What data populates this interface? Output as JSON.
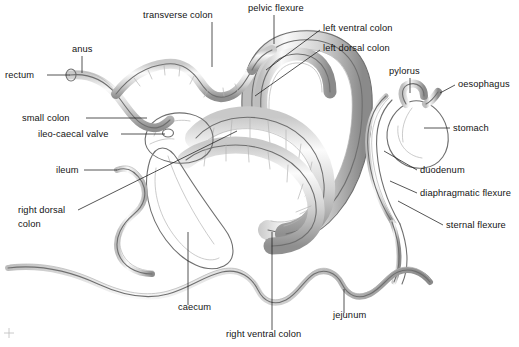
{
  "figure": {
    "background_color": "#ffffff",
    "ink_color": "#141414",
    "organ_outline_color": "#6f6f6f",
    "organ_shade_color": "#b4b4b4",
    "width": 519,
    "height": 347
  },
  "labels": [
    {
      "id": "transverse-colon",
      "text": "transverse colon",
      "x": 143,
      "y": 18,
      "anchor": "start"
    },
    {
      "id": "pelvic-flexure",
      "text": "pelvic flexure",
      "x": 248,
      "y": 11,
      "anchor": "start"
    },
    {
      "id": "left-ventral-colon",
      "text": "left ventral colon",
      "x": 323,
      "y": 31,
      "anchor": "start"
    },
    {
      "id": "left-dorsal-colon",
      "text": "left dorsal colon",
      "x": 323,
      "y": 51,
      "anchor": "start"
    },
    {
      "id": "pylorus",
      "text": "pylorus",
      "x": 389,
      "y": 74,
      "anchor": "start"
    },
    {
      "id": "oesophagus",
      "text": "oesophagus",
      "x": 458,
      "y": 87,
      "anchor": "start"
    },
    {
      "id": "stomach",
      "text": "stomach",
      "x": 453,
      "y": 131,
      "anchor": "start"
    },
    {
      "id": "anus",
      "text": "anus",
      "x": 72,
      "y": 52,
      "anchor": "start"
    },
    {
      "id": "rectum",
      "text": "rectum",
      "x": 5,
      "y": 78,
      "anchor": "start"
    },
    {
      "id": "small-colon",
      "text": "small colon",
      "x": 22,
      "y": 121,
      "anchor": "start"
    },
    {
      "id": "ileo-caecal-valve",
      "text": "ileo-caecal valve",
      "x": 38,
      "y": 137,
      "anchor": "start"
    },
    {
      "id": "ileum",
      "text": "ileum",
      "x": 56,
      "y": 173,
      "anchor": "start"
    },
    {
      "id": "right-dorsal-colon-1",
      "text": "right dorsal",
      "x": 18,
      "y": 213,
      "anchor": "start"
    },
    {
      "id": "right-dorsal-colon-2",
      "text": "colon",
      "x": 18,
      "y": 227,
      "anchor": "start"
    },
    {
      "id": "duodenum",
      "text": "duodenum",
      "x": 420,
      "y": 173,
      "anchor": "start"
    },
    {
      "id": "diaphragmatic-flexure",
      "text": "diaphragmatic flexure",
      "x": 420,
      "y": 196,
      "anchor": "start"
    },
    {
      "id": "sternal-flexure",
      "text": "sternal flexure",
      "x": 446,
      "y": 228,
      "anchor": "start"
    },
    {
      "id": "caecum",
      "text": "caecum",
      "x": 178,
      "y": 310,
      "anchor": "start"
    },
    {
      "id": "right-ventral-colon",
      "text": "right ventral colon",
      "x": 226,
      "y": 337,
      "anchor": "start"
    },
    {
      "id": "jejunum",
      "text": "jejunum",
      "x": 333,
      "y": 318,
      "anchor": "start"
    }
  ],
  "leaders": [
    {
      "id": "leader-transverse-colon",
      "d": "M 212 22 L 212 67"
    },
    {
      "id": "leader-pelvic-flexure",
      "d": "M 274 15 L 274 44"
    },
    {
      "id": "leader-left-ventral-colon",
      "d": "M 320 30 L 266 70"
    },
    {
      "id": "leader-left-dorsal-colon",
      "d": "M 320 50 L 255 96"
    },
    {
      "id": "leader-pylorus",
      "d": "M 410 78 L 410 93"
    },
    {
      "id": "leader-oesophagus",
      "d": "M 455 85 L 440 93"
    },
    {
      "id": "leader-stomach",
      "d": "M 450 128 L 424 128"
    },
    {
      "id": "leader-anus",
      "d": "M 82 56 L 82 73"
    },
    {
      "id": "leader-rectum",
      "d": "M 47 75 L 70 75"
    },
    {
      "id": "leader-small-colon",
      "d": "M 86 118 L 147 118"
    },
    {
      "id": "leader-ileo-caecal-valve",
      "d": "M 121 134 L 165 134"
    },
    {
      "id": "leader-ileum",
      "d": "M 84 170 L 117 170"
    },
    {
      "id": "leader-right-dorsal-colon",
      "d": "M 78 210 L 237 131"
    },
    {
      "id": "leader-duodenum",
      "d": "M 417 170 L 384 151"
    },
    {
      "id": "leader-diaphragmatic-flexure",
      "d": "M 417 193 L 390 181"
    },
    {
      "id": "leader-sternal-flexure",
      "d": "M 443 225 L 398 201"
    },
    {
      "id": "leader-caecum",
      "d": "M 188 305 L 188 232"
    },
    {
      "id": "leader-right-ventral-colon",
      "d": "M 272 330 L 272 232"
    },
    {
      "id": "leader-jejunum",
      "d": "M 344 313 L 344 289"
    }
  ],
  "organs": {
    "small_colon": "rectum through small colon — narrow sacculated tube, upper left",
    "large_colon": "double horseshoe of ventral and dorsal colon — centre",
    "caecum": "large comma-shaped sac — centre lower",
    "stomach": "J-shaped sac with oesophagus and pylorus — right",
    "jejunum": "long wavy small-intestine loop — lower margin"
  }
}
